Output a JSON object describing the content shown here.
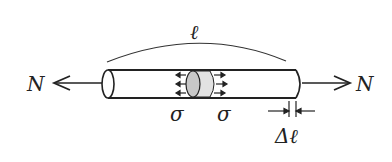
{
  "diagram": {
    "length_label": "ℓ",
    "force_left": "N",
    "force_right": "N",
    "stress_left": "σ",
    "stress_right": "σ",
    "elongation_label": "Δℓ",
    "colors": {
      "stroke": "#222222",
      "shade": "#cfcfcf",
      "background": "#ffffff"
    }
  }
}
